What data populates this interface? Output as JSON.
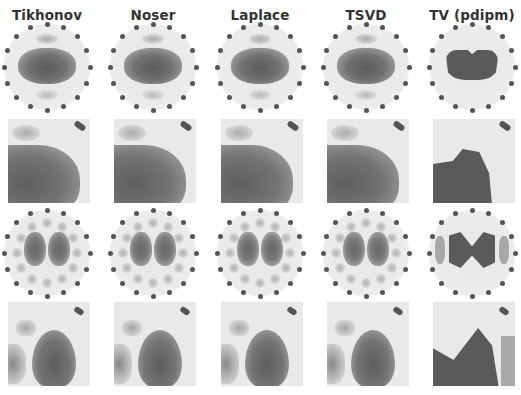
{
  "figure": {
    "columns": [
      {
        "title": "Tikhonov",
        "style": "smooth"
      },
      {
        "title": "Noser",
        "style": "smooth"
      },
      {
        "title": "Laplace",
        "style": "smooth"
      },
      {
        "title": "TSVD",
        "style": "smooth"
      },
      {
        "title": "TV (pdipm)",
        "style": "piecewise"
      }
    ],
    "rows": [
      {
        "kind": "full-reconstruction",
        "target": "single-inclusion"
      },
      {
        "kind": "zoomed-reconstruction",
        "target": "single-inclusion"
      },
      {
        "kind": "full-reconstruction",
        "target": "two-inclusions"
      },
      {
        "kind": "zoomed-reconstruction",
        "target": "two-inclusions"
      }
    ],
    "electrodes_per_ring": 16,
    "colormap": "grayscale",
    "colors": {
      "background": "#ffffff",
      "domain": "#ebebeb",
      "inclusion_dark": "#5a5a5a",
      "inclusion_mid": "#8a8a8a",
      "electrode": "#555555",
      "title_text": "#333333"
    }
  }
}
